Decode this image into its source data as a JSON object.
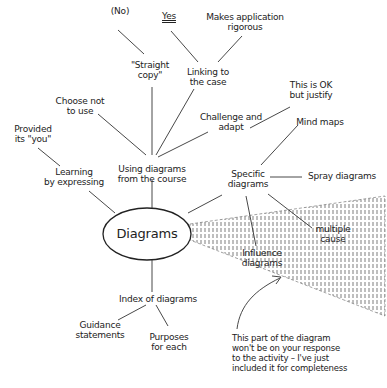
{
  "diagram": {
    "type": "spray diagram",
    "center": {
      "label": "Diagrams"
    },
    "branches": [
      {
        "label": "Using diagrams\nfrom the course",
        "children": [
          {
            "label": "Choose not\nto use"
          },
          {
            "label": "\"Straight\ncopy\"",
            "children": [
              {
                "label": "(No)"
              }
            ]
          },
          {
            "label": "Linking to\nthe case",
            "children": [
              {
                "label": "Yes"
              },
              {
                "label": "Makes application\nrigorous"
              }
            ]
          },
          {
            "label": "Challenge and\nadapt",
            "children": [
              {
                "label": "This is OK\nbut justify"
              }
            ]
          }
        ]
      },
      {
        "label": "Learning\nby expressing",
        "children": [
          {
            "label": "Provided\nits \"you\""
          }
        ]
      },
      {
        "label": "Specific\ndiagrams",
        "children": [
          {
            "label": "Mind maps"
          },
          {
            "label": "Spray diagrams"
          },
          {
            "label": "Multiple\ncause"
          },
          {
            "label": "Influence\ndiagrams"
          }
        ]
      },
      {
        "label": "Index of diagrams",
        "children": [
          {
            "label": "Guidance\nstatements"
          },
          {
            "label": "Purposes\nfor each"
          }
        ]
      }
    ],
    "annotation": "This part of the diagram\nwon't be on your response\nto the activity – I've just\nincluded it for completeness"
  },
  "labels": {
    "no": "(No)",
    "yes": "Yes",
    "makes_app": "Makes application\nrigorous",
    "straight_copy": "\"Straight\ncopy\"",
    "linking": "Linking to\nthe case",
    "ok_justify": "This is OK\nbut justify",
    "choose_not": "Choose not\nto use",
    "challenge": "Challenge and\nadapt",
    "mind_maps": "Mind maps",
    "provided": "Provided\nits \"you\"",
    "learning": "Learning\nby expressing",
    "using": "Using diagrams\nfrom the course",
    "specific": "Specific\ndiagrams",
    "spray": "Spray diagrams",
    "center": "Diagrams",
    "multiple": "multiple\ncause",
    "influence": "Influence\ndiagrams",
    "index": "Index of diagrams",
    "guidance": "Guidance\nstatements",
    "purposes": "Purposes\nfor each",
    "annotation": "This part of the diagram\nwon't be on your response\nto the activity – I've just\nincluded it for completeness"
  },
  "colors": {
    "ink": "#222222",
    "background": "#ffffff"
  }
}
